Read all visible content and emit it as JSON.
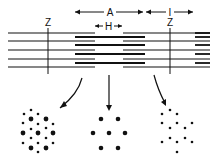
{
  "labels": {
    "a_band": "A",
    "i_band": "I",
    "h_zone": "H",
    "z_line_left": "Z",
    "z_line_right": "Z"
  },
  "colors": {
    "ink": "#111111",
    "background": "#ffffff"
  },
  "cross_sections": [
    {
      "region": "overlap (A band)",
      "pattern": "hexagonal thick + thin"
    },
    {
      "region": "H zone",
      "pattern": "thick only"
    },
    {
      "region": "I band",
      "pattern": "thin only"
    }
  ]
}
